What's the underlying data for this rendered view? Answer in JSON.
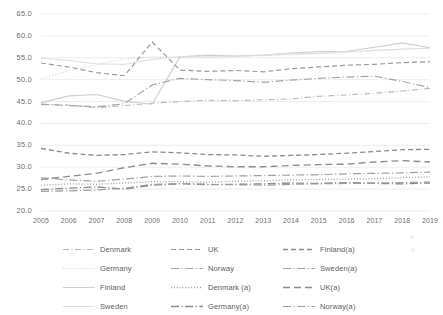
{
  "chart_data": {
    "type": "line",
    "title": "",
    "xlabel": "",
    "ylabel": "",
    "ylim": [
      20.0,
      65.0
    ],
    "ytick_step": 5.0,
    "grid": true,
    "legend_position": "bottom",
    "yticks": [
      "65.0",
      "60.0",
      "55.0",
      "50.0",
      "45.0",
      "40.0",
      "35.0",
      "30.0",
      "25.0",
      "20.0"
    ],
    "categories": [
      "2005",
      "2006",
      "2007",
      "2008",
      "2009",
      "2010",
      "2011",
      "2012",
      "2013",
      "2014",
      "2015",
      "2016",
      "2017",
      "2018",
      "2019"
    ],
    "series": [
      {
        "name": "Denmark",
        "style": "dash-dot",
        "color": "#b9b9b9",
        "width": 1.1,
        "values": [
          44.3,
          44.2,
          43.6,
          44.1,
          44.6,
          45.0,
          45.3,
          45.2,
          45.4,
          45.6,
          46.2,
          46.5,
          46.9,
          47.4,
          48.0
        ]
      },
      {
        "name": "Germany",
        "style": "dotted",
        "color": "#d2cfc9",
        "width": 1.2,
        "values": [
          50.2,
          52.0,
          53.4,
          54.8,
          55.2,
          55.1,
          55.3,
          55.4,
          55.5,
          55.7,
          55.9,
          56.2,
          56.6,
          56.9,
          57.2
        ]
      },
      {
        "name": "Finland",
        "style": "solid",
        "color": "#cfcfcf",
        "width": 1.1,
        "values": [
          44.7,
          46.3,
          46.6,
          45.1,
          44.4,
          55.2,
          55.6,
          55.4,
          55.6,
          56.1,
          56.4,
          56.5,
          57.4,
          58.4,
          57.3
        ]
      },
      {
        "name": "Sweden",
        "style": "solid",
        "color": "#dedede",
        "width": 1.0,
        "values": [
          54.9,
          54.4,
          53.6,
          53.5,
          54.6,
          55.3,
          55.1,
          55.3,
          55.6,
          55.9,
          56.0,
          56.4,
          56.7,
          57.0,
          57.2
        ]
      },
      {
        "name": "UK",
        "style": "dashed",
        "color": "#9a9a9a",
        "width": 1.2,
        "values": [
          53.8,
          52.9,
          51.6,
          50.9,
          58.6,
          52.2,
          51.9,
          52.1,
          51.8,
          52.5,
          52.9,
          53.3,
          53.5,
          53.9,
          54.1
        ]
      },
      {
        "name": "Norway",
        "style": "solid-dot",
        "color": "#a6a6a6",
        "width": 1.2,
        "values": [
          44.4,
          44.1,
          43.8,
          44.5,
          48.8,
          50.3,
          50.0,
          49.8,
          49.4,
          49.9,
          50.3,
          50.6,
          50.8,
          49.6,
          48.2
        ]
      },
      {
        "name": "Denmark (a)",
        "style": "dotted",
        "color": "#8f8f8f",
        "width": 1.3,
        "values": [
          25.9,
          26.2,
          26.1,
          26.4,
          26.7,
          26.7,
          26.6,
          26.8,
          26.9,
          27.1,
          27.2,
          27.3,
          27.4,
          27.6,
          27.8
        ]
      },
      {
        "name": "Germany(a)",
        "style": "solid-dot",
        "color": "#8c8c8c",
        "width": 1.3,
        "values": [
          24.9,
          25.2,
          25.5,
          25.0,
          25.9,
          26.2,
          26.0,
          26.1,
          26.2,
          26.4,
          26.3,
          26.5,
          26.3,
          26.2,
          26.4
        ]
      },
      {
        "name": "Finland(a)",
        "style": "dashed",
        "color": "#8a8a8a",
        "width": 1.3,
        "values": [
          34.3,
          33.2,
          32.7,
          32.9,
          33.5,
          33.3,
          32.9,
          32.8,
          32.5,
          32.7,
          32.9,
          33.2,
          33.6,
          34.0,
          34.1
        ]
      },
      {
        "name": "Sweden(a)",
        "style": "solid-dot",
        "color": "#a0a0a0",
        "width": 1.2,
        "values": [
          27.6,
          27.1,
          26.8,
          27.3,
          27.9,
          28.0,
          27.9,
          28.0,
          28.1,
          28.2,
          28.3,
          28.5,
          28.6,
          28.7,
          28.9
        ]
      },
      {
        "name": "UK(a)",
        "style": "dashed-long",
        "color": "#8d8d8d",
        "width": 1.4,
        "values": [
          27.2,
          27.9,
          28.6,
          29.9,
          30.9,
          30.7,
          30.3,
          30.1,
          30.1,
          30.4,
          30.6,
          30.7,
          31.2,
          31.5,
          31.2
        ]
      },
      {
        "name": "Norway(a)",
        "style": "solid-dot",
        "color": "#9d9d9d",
        "width": 1.2,
        "values": [
          24.5,
          24.6,
          24.8,
          25.2,
          26.1,
          26.3,
          26.1,
          26.0,
          25.9,
          26.1,
          26.2,
          26.3,
          26.4,
          26.5,
          26.6
        ]
      }
    ],
    "legend_order": [
      "Denmark",
      "UK",
      "Finland(a)",
      "Germany",
      "Norway",
      "Sweden(a)",
      "Finland",
      "Denmark (a)",
      "UK(a)",
      "Sweden",
      "Germany(a)",
      "Norway(a)"
    ]
  }
}
